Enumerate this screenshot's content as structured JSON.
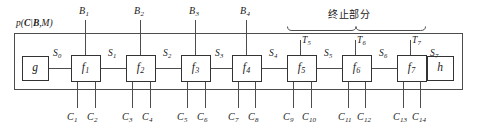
{
  "figure": {
    "type": "factor-graph-diagram",
    "plate_label": "p(C|B,M)",
    "plate_label_parts": {
      "p": "p(",
      "c": "C",
      "bar": "|",
      "b": "B",
      "comma": ",",
      "m": "M",
      "close": ")"
    },
    "brace_annotation": "终止部分"
  },
  "nodes": {
    "start": {
      "label": "g",
      "x": 22,
      "y": 56,
      "w": 26,
      "h": 24
    },
    "end": {
      "label": "h",
      "x": 427,
      "y": 56,
      "w": 26,
      "h": 24
    },
    "factors": [
      {
        "label": "f",
        "sub": "1",
        "x": 71,
        "y": 55,
        "w": 29,
        "h": 26
      },
      {
        "label": "f",
        "sub": "2",
        "x": 126,
        "y": 55,
        "w": 29,
        "h": 26
      },
      {
        "label": "f",
        "sub": "3",
        "x": 181,
        "y": 55,
        "w": 29,
        "h": 26
      },
      {
        "label": "f",
        "sub": "4",
        "x": 232,
        "y": 55,
        "w": 29,
        "h": 26
      },
      {
        "label": "f",
        "sub": "5",
        "x": 287,
        "y": 55,
        "w": 29,
        "h": 26
      },
      {
        "label": "f",
        "sub": "6",
        "x": 342,
        "y": 55,
        "w": 29,
        "h": 26
      },
      {
        "label": "f",
        "sub": "7",
        "x": 397,
        "y": 55,
        "w": 29,
        "h": 26
      }
    ]
  },
  "state_labels": [
    {
      "label": "S",
      "sub": "0",
      "x": 53,
      "y": 49
    },
    {
      "label": "S",
      "sub": "1",
      "x": 108,
      "y": 49
    },
    {
      "label": "S",
      "sub": "2",
      "x": 163,
      "y": 49
    },
    {
      "label": "S",
      "sub": "3",
      "x": 215,
      "y": 49
    },
    {
      "label": "S",
      "sub": "4",
      "x": 269,
      "y": 49
    },
    {
      "label": "S",
      "sub": "5",
      "x": 324,
      "y": 49
    },
    {
      "label": "S",
      "sub": "6",
      "x": 379,
      "y": 49
    },
    {
      "label": "S",
      "sub": "7",
      "x": 430,
      "y": 49
    }
  ],
  "input_labels": [
    {
      "label": "B",
      "sub": "1",
      "x": 79,
      "y": 6,
      "line_x": 85,
      "line_y1": 20,
      "line_y2": 55
    },
    {
      "label": "B",
      "sub": "2",
      "x": 134,
      "y": 6,
      "line_x": 140,
      "line_y1": 20,
      "line_y2": 55
    },
    {
      "label": "B",
      "sub": "3",
      "x": 189,
      "y": 6,
      "line_x": 195,
      "line_y1": 20,
      "line_y2": 55
    },
    {
      "label": "B",
      "sub": "4",
      "x": 240,
      "y": 6,
      "line_x": 246,
      "line_y1": 20,
      "line_y2": 55
    }
  ],
  "termination_labels": [
    {
      "label": "T",
      "sub": "5",
      "x": 302,
      "y": 36,
      "line_x": 300,
      "line_y1": 40,
      "line_y2": 55
    },
    {
      "label": "T",
      "sub": "6",
      "x": 357,
      "y": 36,
      "line_x": 355,
      "line_y1": 40,
      "line_y2": 55
    },
    {
      "label": "T",
      "sub": "7",
      "x": 412,
      "y": 36,
      "line_x": 410,
      "line_y1": 40,
      "line_y2": 55
    }
  ],
  "output_labels": [
    {
      "label": "C",
      "sub": "1",
      "x": 67,
      "y": 112,
      "line_x": 77,
      "line_y1": 81,
      "line_y2": 108
    },
    {
      "label": "C",
      "sub": "2",
      "x": 87,
      "y": 112,
      "line_x": 95,
      "line_y1": 81,
      "line_y2": 108
    },
    {
      "label": "C",
      "sub": "3",
      "x": 122,
      "y": 112,
      "line_x": 132,
      "line_y1": 81,
      "line_y2": 108
    },
    {
      "label": "C",
      "sub": "4",
      "x": 142,
      "y": 112,
      "line_x": 150,
      "line_y1": 81,
      "line_y2": 108
    },
    {
      "label": "C",
      "sub": "5",
      "x": 177,
      "y": 112,
      "line_x": 187,
      "line_y1": 81,
      "line_y2": 108
    },
    {
      "label": "C",
      "sub": "6",
      "x": 197,
      "y": 112,
      "line_x": 205,
      "line_y1": 81,
      "line_y2": 108
    },
    {
      "label": "C",
      "sub": "7",
      "x": 228,
      "y": 112,
      "line_x": 238,
      "line_y1": 81,
      "line_y2": 108
    },
    {
      "label": "C",
      "sub": "8",
      "x": 248,
      "y": 112,
      "line_x": 255,
      "line_y1": 81,
      "line_y2": 108
    },
    {
      "label": "C",
      "sub": "9",
      "x": 283,
      "y": 112,
      "line_x": 293,
      "line_y1": 81,
      "line_y2": 108
    },
    {
      "label": "C",
      "sub": "10",
      "x": 302,
      "y": 112,
      "line_x": 311,
      "line_y1": 81,
      "line_y2": 108
    },
    {
      "label": "C",
      "sub": "11",
      "x": 338,
      "y": 112,
      "line_x": 348,
      "line_y1": 81,
      "line_y2": 108
    },
    {
      "label": "C",
      "sub": "12",
      "x": 357,
      "y": 112,
      "line_x": 365,
      "line_y1": 81,
      "line_y2": 108
    },
    {
      "label": "C",
      "sub": "13",
      "x": 393,
      "y": 112,
      "line_x": 403,
      "line_y1": 81,
      "line_y2": 108
    },
    {
      "label": "C",
      "sub": "14",
      "x": 412,
      "y": 112,
      "line_x": 420,
      "line_y1": 81,
      "line_y2": 108
    }
  ],
  "plate": {
    "x": 14,
    "y": 33,
    "w": 448,
    "h": 56
  },
  "brace": {
    "x1": 287,
    "x2": 425,
    "y": 30,
    "tip_x": 356
  },
  "colors": {
    "stroke": "#4d4d4d",
    "box_stroke": "#333333",
    "text": "#1a1a1a",
    "background": "#ffffff"
  }
}
